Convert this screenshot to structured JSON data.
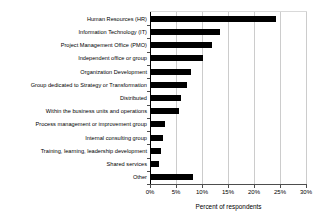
{
  "chart_data": {
    "type": "bar",
    "orientation": "horizontal",
    "title": "",
    "xlabel": "Percent of respondents",
    "ylabel": "",
    "xlim": [
      0,
      30
    ],
    "xtick_labels": [
      "0%",
      "5%",
      "10%",
      "15%",
      "20%",
      "25%",
      "30%"
    ],
    "xtick_values": [
      0,
      5,
      10,
      15,
      20,
      25,
      30
    ],
    "xtick_suffix": "%",
    "grid": true,
    "grid_axis": "x",
    "legend": null,
    "bar_color": "#000000",
    "categories": [
      "Human Resources (HR)",
      "Information Technology (IT)",
      "Project Management Office (PMO)",
      "Independent office or group",
      "Organization Development",
      "Group dedicated to Strategy or Transformation",
      "Distributed",
      "Within the business units and operations",
      "Process management or improvement group",
      "Internal consulting group",
      "Training, learning, leadership development",
      "Shared services",
      "Other"
    ],
    "values": [
      24.0,
      13.3,
      11.7,
      10.0,
      7.6,
      7.0,
      5.7,
      5.3,
      2.7,
      2.4,
      1.9,
      1.5,
      8.0
    ]
  }
}
